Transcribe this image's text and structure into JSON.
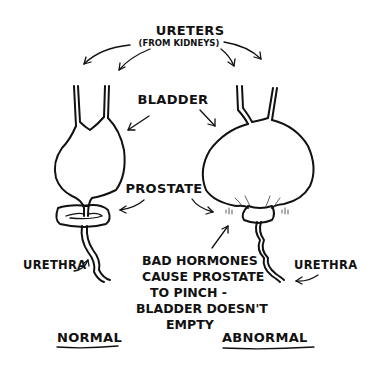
{
  "diagram": {
    "labels": {
      "ureters": "URETERS",
      "ureters_sub": "(FROM KIDNEYS)",
      "bladder": "BLADDER",
      "prostate": "PROSTATE",
      "urethra_left": "URETHRA",
      "urethra_right": "URETHRA",
      "normal": "NORMAL",
      "abnormal": "ABNORMAL"
    },
    "note": {
      "line1": "BAD HORMONES",
      "line2": "CAUSE PROSTATE",
      "line3": "TO PINCH -",
      "line4": "BLADDER DOESN'T",
      "line5": "EMPTY"
    },
    "colors": {
      "ink": "#111111",
      "background": "#ffffff"
    }
  }
}
